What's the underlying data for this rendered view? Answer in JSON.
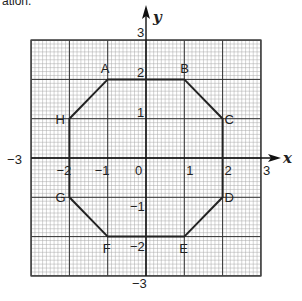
{
  "caption_fragment": "ation.",
  "axes": {
    "x_label": "x",
    "y_label": "y",
    "x_range": [
      -3,
      3
    ],
    "y_range": [
      -3,
      3
    ],
    "x_ticks": [
      "−3",
      "−2",
      "−1",
      "0",
      "1",
      "2",
      "3"
    ],
    "y_ticks": [
      "3",
      "2",
      "1",
      "−1",
      "−2",
      "−3"
    ]
  },
  "grid": {
    "major_step": 1,
    "minor_step": 0.1,
    "color_minor": "#a8a8a8",
    "color_major": "#333333"
  },
  "shape": {
    "type": "octagon",
    "stroke_color": "#222222",
    "vertices": [
      {
        "label": "A",
        "x": -1,
        "y": 2
      },
      {
        "label": "B",
        "x": 1,
        "y": 2
      },
      {
        "label": "C",
        "x": 2,
        "y": 1
      },
      {
        "label": "D",
        "x": 2,
        "y": -1
      },
      {
        "label": "E",
        "x": 1,
        "y": -2
      },
      {
        "label": "F",
        "x": -1,
        "y": -2
      },
      {
        "label": "G",
        "x": -2,
        "y": -1
      },
      {
        "label": "H",
        "x": -2,
        "y": 1
      }
    ]
  }
}
